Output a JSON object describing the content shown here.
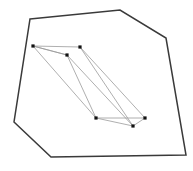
{
  "figure": {
    "canvas": {
      "width": 193,
      "height": 171,
      "background": "#ffffff"
    },
    "colors": {
      "outer_stroke": "#3a3a3a",
      "inner_stroke": "#9a9a9a",
      "vertex_fill": "#111111"
    },
    "strokes": {
      "outer_width": 1.5,
      "inner_width": 0.8
    }
  },
  "chart_data": {
    "type": "diagram",
    "xlabel": "",
    "ylabel": "",
    "xlim": [
      0,
      193
    ],
    "ylim": [
      0,
      171
    ],
    "grid": false,
    "legend": "none",
    "series": [
      {
        "name": "outer-hull",
        "kind": "closed-polygon",
        "stroke": "#3a3a3a",
        "stroke_width": 1.5,
        "vertex_count": 7,
        "points": [
          [
            30,
            19
          ],
          [
            120,
            10
          ],
          [
            166,
            38
          ],
          [
            186,
            155
          ],
          [
            51,
            157
          ],
          [
            14,
            122
          ],
          [
            30,
            19
          ]
        ],
        "path": "M 30 19 L 120 10 L 166 38 L 186 155 L 51 157 L 14 122 Z"
      },
      {
        "name": "inner-polygon",
        "kind": "closed-polygon",
        "stroke": "#9a9a9a",
        "stroke_width": 0.8,
        "vertex_count": 6,
        "points": [
          [
            33,
            46
          ],
          [
            80,
            47
          ],
          [
            145,
            118
          ],
          [
            133,
            126
          ],
          [
            96,
            118
          ],
          [
            67,
            55
          ],
          [
            33,
            46
          ]
        ],
        "path": "M 33 46 L 80 47 L 145 118 L 133 126 L 96 118 L 67 55 Z"
      },
      {
        "name": "inner-diagonals",
        "kind": "chords",
        "stroke": "#9a9a9a",
        "stroke_width": 0.8,
        "segments": [
          {
            "from": [
              33,
              46
            ],
            "to": [
              67,
              55
            ]
          },
          {
            "from": [
              33,
              46
            ],
            "to": [
              96,
              118
            ]
          },
          {
            "from": [
              80,
              47
            ],
            "to": [
              133,
              126
            ]
          },
          {
            "from": [
              96,
              118
            ],
            "to": [
              145,
              118
            ]
          },
          {
            "from": [
              67,
              55
            ],
            "to": [
              133,
              126
            ]
          }
        ]
      }
    ],
    "vertex_markers": {
      "name": "inner-vertex-markers",
      "shape": "square",
      "size": 3.2,
      "fill": "#111111",
      "points": [
        [
          33,
          46
        ],
        [
          80,
          47
        ],
        [
          67,
          55
        ],
        [
          96,
          118
        ],
        [
          145,
          118
        ],
        [
          133,
          126
        ]
      ]
    }
  }
}
